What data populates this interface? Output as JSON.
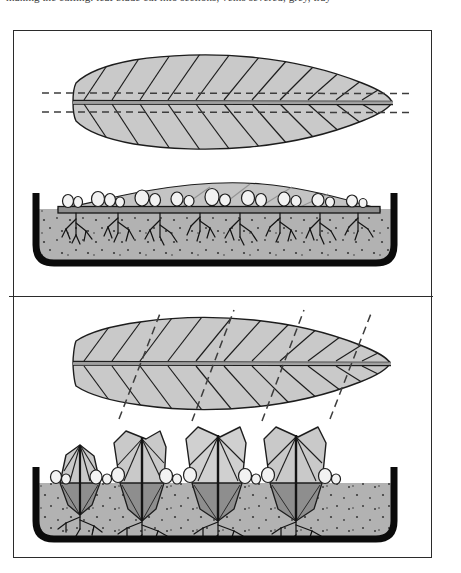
{
  "caption": {
    "text": "making the cutting: leaf blade cut into sections, veins severed, grey, tray"
  },
  "figure": {
    "panels": [
      {
        "id": "panel-top",
        "name": "midrib-parallel-cut-method",
        "label": "Leaf with cuts parallel to midrib, laid flat on compost",
        "steps": [
          {
            "id": "step-leaf-top",
            "name": "leaf-with-parallel-cuts",
            "label": "Whole leaf, dashed cut lines run lengthwise either side of the midrib",
            "cut_line_style": "dashed",
            "cut_line_count": 2,
            "cut_orientation": "parallel-to-midrib",
            "vein_count": 18
          },
          {
            "id": "step-tray-top",
            "name": "tray-leaf-laid-flat",
            "label": "Cut leaf pegged flat on the compost surface; plantlets and roots form along the severed veins",
            "plantlet_count": 9,
            "root_cluster_count": 8,
            "leaf_position": "horizontal-on-surface"
          }
        ]
      },
      {
        "id": "panel-bottom",
        "name": "chevron-cut-method",
        "label": "Leaf cut into chevron sections, inserted upright into compost",
        "steps": [
          {
            "id": "step-leaf-bottom",
            "name": "leaf-with-diagonal-cuts",
            "label": "Whole leaf, dashed cut lines run diagonally across the midrib",
            "cut_line_style": "dashed",
            "cut_line_count": 4,
            "cut_orientation": "diagonal-across-midrib",
            "vein_count": 18
          },
          {
            "id": "step-tray-bottom",
            "name": "tray-chevron-sections-upright",
            "label": "V-shaped leaf sections stood upright in the compost; plantlets and roots form at the buried cut edge",
            "section_count": 4,
            "plantlet_count": 8,
            "root_cluster_count": 4,
            "leaf_position": "upright-in-compost"
          }
        ]
      }
    ]
  },
  "colors": {
    "frame_line": "#2b2b2b",
    "leaf_fill": "#c9c9c9",
    "leaf_fill_light": "#d5d5d5",
    "leaf_outline": "#1d1d1d",
    "leaf_submerged": "#8e8e8e",
    "midrib": "#222222",
    "cut_line": "#444444",
    "compost": "#b2b2b2",
    "compost_speckle": "#3a3a3a",
    "compost_mound": "#c4c4c4",
    "tray_wall": "#0b0b0b",
    "plantlet": "#f2f2f2",
    "plantlet_outline": "#1d1d1d",
    "root": "#141414",
    "background": "#ffffff"
  },
  "geometry": {
    "frame": {
      "x": 13,
      "y": 30,
      "w": 419,
      "h": 528
    },
    "divider_y": 265,
    "tray_top": {
      "x": 20,
      "y": 196,
      "w": 380,
      "h": 82
    },
    "tray_bottom": {
      "x": 20,
      "y": 190,
      "w": 380,
      "h": 84
    }
  }
}
